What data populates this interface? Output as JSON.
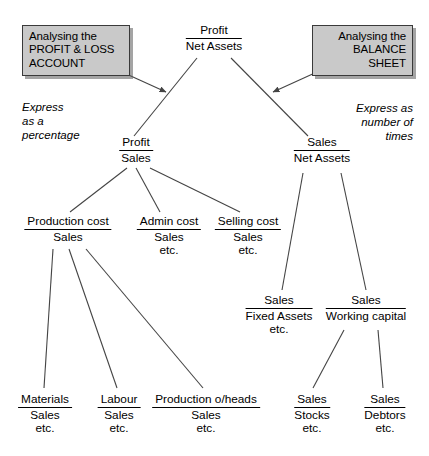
{
  "diagram": {
    "title_nodes": {},
    "callouts": [
      {
        "id": "profit-loss-account",
        "lines": [
          "Analysing the",
          "PROFIT & LOSS",
          "ACCOUNT"
        ],
        "fill": "#c9c9c9",
        "border": "#3a3a3a"
      },
      {
        "id": "balance-sheet",
        "lines": [
          "Analysing the",
          "BALANCE",
          "SHEET"
        ],
        "fill": "#c9c9c9",
        "border": "#3a3a3a"
      }
    ],
    "annotations": [
      {
        "id": "express-as-percentage",
        "lines": [
          "Express",
          "as a",
          "percentage"
        ]
      },
      {
        "id": "express-as-number-of-times",
        "lines": [
          "Express as",
          "number of",
          "times"
        ]
      }
    ],
    "nodes": [
      {
        "id": "profit-net-assets",
        "numerator": "Profit",
        "denominator": "Net Assets",
        "etc": ""
      },
      {
        "id": "profit-sales",
        "numerator": "Profit",
        "denominator": "Sales",
        "etc": ""
      },
      {
        "id": "sales-net-assets",
        "numerator": "Sales",
        "denominator": "Net Assets",
        "etc": ""
      },
      {
        "id": "production-cost-sales",
        "numerator": "Production cost",
        "denominator": "Sales",
        "etc": ""
      },
      {
        "id": "admin-cost-sales",
        "numerator": "Admin cost",
        "denominator": "Sales",
        "etc": "etc."
      },
      {
        "id": "selling-cost-sales",
        "numerator": "Selling cost",
        "denominator": "Sales",
        "etc": "etc."
      },
      {
        "id": "sales-fixed-assets",
        "numerator": "Sales",
        "denominator": "Fixed Assets",
        "etc": "etc."
      },
      {
        "id": "sales-working-capital",
        "numerator": "Sales",
        "denominator": "Working capital",
        "etc": ""
      },
      {
        "id": "materials-sales",
        "numerator": "Materials",
        "denominator": "Sales",
        "etc": "etc."
      },
      {
        "id": "labour-sales",
        "numerator": "Labour",
        "denominator": "Sales",
        "etc": "etc."
      },
      {
        "id": "production-overheads-sales",
        "numerator": "Production o/heads",
        "denominator": "Sales",
        "etc": "etc."
      },
      {
        "id": "sales-stocks",
        "numerator": "Sales",
        "denominator": "Stocks",
        "etc": "etc."
      },
      {
        "id": "sales-debtors",
        "numerator": "Sales",
        "denominator": "Debtors",
        "etc": "etc."
      }
    ],
    "colors": {
      "line": "#444444",
      "text": "#000000",
      "box_fill": "#c9c9c9",
      "box_border": "#3a3a3a",
      "background": "#ffffff"
    }
  }
}
